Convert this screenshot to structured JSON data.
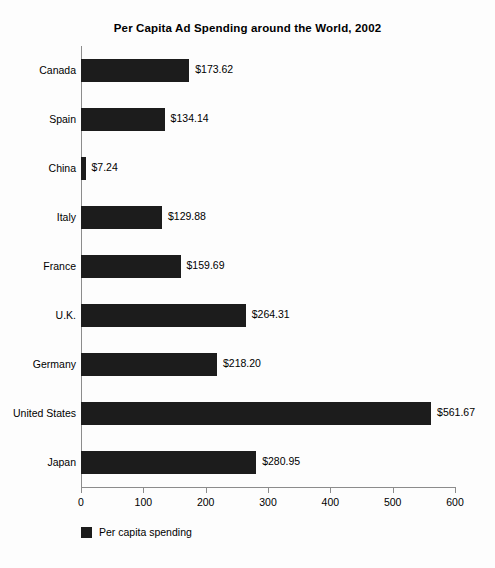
{
  "chart_data": {
    "type": "bar",
    "orientation": "horizontal",
    "title": "Per Capita Ad Spending around the World, 2002",
    "xlabel": "",
    "ylabel": "",
    "xlim": [
      0,
      600
    ],
    "xticks": [
      0,
      100,
      200,
      300,
      400,
      500,
      600
    ],
    "xtick_labels": [
      "0",
      "100",
      "200",
      "300",
      "400",
      "500",
      "600"
    ],
    "grid": false,
    "legend_position": "bottom-left",
    "bar_color": "#1c1c1c",
    "categories": [
      "Canada",
      "Spain",
      "China",
      "Italy",
      "France",
      "U.K.",
      "Germany",
      "United States",
      "Japan"
    ],
    "values": [
      173.62,
      134.14,
      7.24,
      129.88,
      159.69,
      264.31,
      218.2,
      561.67,
      280.95
    ],
    "value_labels": [
      "$173.62",
      "$134.14",
      "$7.24",
      "$129.88",
      "$159.69",
      "$264.31",
      "$218.20",
      "$561.67",
      "$280.95"
    ],
    "series": [
      {
        "name": "Per capita spending",
        "values": [
          173.62,
          134.14,
          7.24,
          129.88,
          159.69,
          264.31,
          218.2,
          561.67,
          280.95
        ]
      }
    ],
    "legend": [
      "Per capita spending"
    ]
  }
}
